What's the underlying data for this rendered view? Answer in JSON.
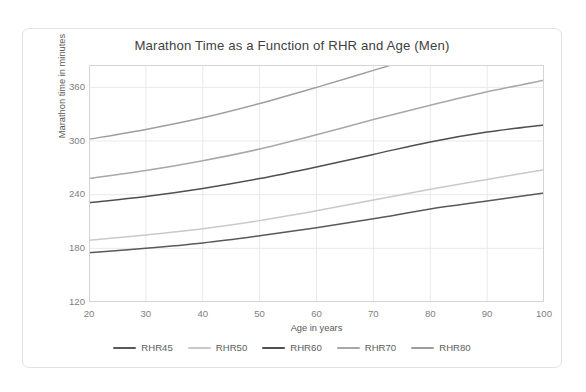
{
  "chart_data": {
    "type": "line",
    "title": "Marathon Time as a Function of RHR and Age (Men)",
    "xlabel": "Age in years",
    "ylabel": "Marathon time in minutes",
    "xlim": [
      20,
      100
    ],
    "ylim": [
      120,
      385
    ],
    "xticks": [
      20,
      30,
      40,
      50,
      60,
      70,
      80,
      90,
      100
    ],
    "yticks": [
      120,
      180,
      240,
      300,
      360
    ],
    "grid": true,
    "legend_position": "bottom",
    "x": [
      20,
      30,
      40,
      50,
      60,
      70,
      80,
      90,
      100
    ],
    "series": [
      {
        "name": "RHR45",
        "color": "#595959",
        "values": [
          175,
          180,
          186,
          194,
          203,
          213,
          224,
          233,
          242
        ]
      },
      {
        "name": "RHR50",
        "color": "#c9c9c9",
        "values": [
          189,
          195,
          202,
          211,
          222,
          234,
          246,
          257,
          268
        ]
      },
      {
        "name": "RHR60",
        "color": "#4f4f4f",
        "values": [
          231,
          238,
          247,
          258,
          271,
          285,
          299,
          310,
          318
        ]
      },
      {
        "name": "RHR70",
        "color": "#a8a8a8",
        "values": [
          258,
          267,
          278,
          291,
          307,
          324,
          340,
          355,
          368
        ]
      },
      {
        "name": "RHR80",
        "color": "#9e9e9e",
        "values": [
          302,
          313,
          326,
          342,
          360,
          379,
          398,
          416,
          432
        ]
      }
    ]
  },
  "axes": {
    "y_tick_labels": [
      "360",
      "300",
      "240",
      "180",
      "120"
    ],
    "x_tick_labels": [
      "20",
      "30",
      "40",
      "50",
      "60",
      "70",
      "80",
      "90",
      "100"
    ]
  },
  "style": {
    "grid_color": "#e9e9e9",
    "frame_color": "#d4d4d4",
    "card_border": "#e2e2e2",
    "title_color": "#3f3f3f",
    "tick_color": "#808080",
    "axis_title_color": "#595959"
  }
}
